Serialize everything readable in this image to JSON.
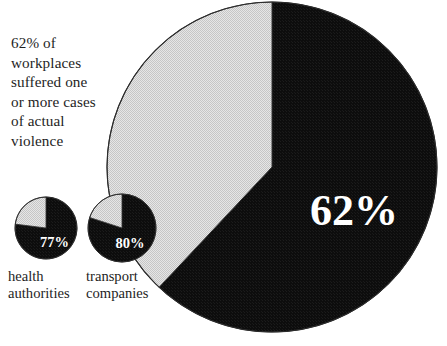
{
  "figure": {
    "background_color": "#ffffff",
    "caption": "62% of\nworkplaces\nsuffered one\nor more cases\nof actual\nviolence",
    "bottom_clipped_text": ""
  },
  "palette": {
    "slice_dark": "#111111",
    "slice_light": "#d8d8d8",
    "outline": "#2b2b2b",
    "label_on_dark": "#ffffff",
    "text": "#1e1e1e"
  },
  "chart_data": {
    "type": "pie",
    "title": "62% of workplaces suffered one or more cases of actual violence",
    "xlabel": "",
    "ylabel": "",
    "legend_position": "none",
    "grid": false,
    "charts": [
      {
        "name": "all-workplaces",
        "role": "main",
        "categories": [
          "suffered one or more cases of actual violence",
          "did not suffer"
        ],
        "values": [
          62,
          38
        ],
        "colors": [
          "#111111",
          "#d8d8d8"
        ],
        "data_label": "62%",
        "label_visible": "62%",
        "caption_label": "",
        "start_angle_deg": 0,
        "direction": "clockwise",
        "center_x": 272,
        "center_y": 167,
        "radius": 165
      },
      {
        "name": "health-authorities",
        "role": "small",
        "categories": [
          "suffered one or more cases of actual violence",
          "did not suffer"
        ],
        "values": [
          77,
          23
        ],
        "colors": [
          "#111111",
          "#d8d8d8"
        ],
        "data_label": "77%",
        "label_visible": "77%",
        "caption_label": "health\nauthorities",
        "start_angle_deg": 0,
        "direction": "clockwise",
        "center_x": 46,
        "center_y": 228,
        "radius": 31
      },
      {
        "name": "transport-companies",
        "role": "small",
        "categories": [
          "suffered one or more cases of actual violence",
          "did not suffer"
        ],
        "values": [
          80,
          20
        ],
        "colors": [
          "#111111",
          "#d8d8d8"
        ],
        "data_label": "80%",
        "label_visible": "80%",
        "caption_label": "transport\ncompanies",
        "start_angle_deg": 0,
        "direction": "clockwise",
        "center_x": 122,
        "center_y": 228,
        "radius": 34
      }
    ]
  }
}
